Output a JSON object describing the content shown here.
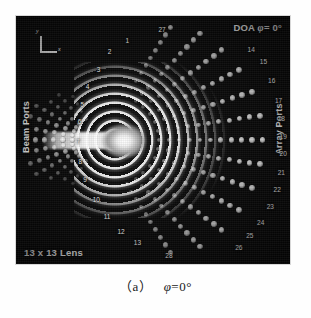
{
  "figure": {
    "title_overlay": "DOA",
    "doa_symbol": "φ",
    "doa_value": "= 0°",
    "lens_label": "13 x 13 Lens",
    "beam_ports_label": "Beam Ports",
    "array_ports_label": "Array Ports",
    "axis_y_label": "y",
    "axis_x_label": "x",
    "beam_port_numbers": [
      "1",
      "2",
      "3",
      "4",
      "5",
      "6",
      "7",
      "8",
      "9",
      "10",
      "11",
      "12",
      "13"
    ],
    "array_port_numbers": [
      "14",
      "15",
      "16",
      "17",
      "18",
      "19",
      "20",
      "21",
      "22",
      "23",
      "24",
      "25",
      "26"
    ],
    "dummy_port_numbers": [
      "27",
      "28"
    ],
    "colors": {
      "panel_background": "#0a0a0a",
      "wavefront_bright": "#ffffff",
      "label_text": "#f0f0f0",
      "page_background": "#ffffff",
      "caption_text": "#1a1a1a"
    }
  },
  "caption": {
    "index": "（a）",
    "symbol": "φ",
    "value": "=0°"
  },
  "chart_data": {
    "type": "heatmap",
    "xlabel": "",
    "ylabel": "",
    "legend_position": "none",
    "grid": false,
    "annotations": [
      {
        "text": "DOA φ= 0°",
        "position": "top-right"
      },
      {
        "text": "13 x 13 Lens",
        "position": "bottom-left"
      },
      {
        "text": "Beam Ports",
        "position": "left",
        "rotation": -90
      },
      {
        "text": "Array Ports",
        "position": "right",
        "rotation": -90
      },
      {
        "text": "y / x axis key",
        "position": "top-left"
      }
    ],
    "excited_port": "7",
    "beam_ports": [
      {
        "label": "1",
        "x": 0.4,
        "y": 0.09
      },
      {
        "label": "2",
        "x": 0.335,
        "y": 0.135
      },
      {
        "label": "3",
        "x": 0.295,
        "y": 0.205
      },
      {
        "label": "4",
        "x": 0.255,
        "y": 0.275
      },
      {
        "label": "5",
        "x": 0.235,
        "y": 0.345
      },
      {
        "label": "6",
        "x": 0.225,
        "y": 0.415
      },
      {
        "label": "7",
        "x": 0.22,
        "y": 0.495
      },
      {
        "label": "8",
        "x": 0.228,
        "y": 0.575
      },
      {
        "label": "9",
        "x": 0.245,
        "y": 0.65
      },
      {
        "label": "10",
        "x": 0.28,
        "y": 0.73
      },
      {
        "label": "11",
        "x": 0.32,
        "y": 0.8
      },
      {
        "label": "12",
        "x": 0.37,
        "y": 0.858
      },
      {
        "label": "13",
        "x": 0.43,
        "y": 0.905
      }
    ],
    "array_ports": [
      {
        "label": "14",
        "x": 0.845,
        "y": 0.125
      },
      {
        "label": "15",
        "x": 0.89,
        "y": 0.175
      },
      {
        "label": "16",
        "x": 0.92,
        "y": 0.25
      },
      {
        "label": "17",
        "x": 0.945,
        "y": 0.33
      },
      {
        "label": "18",
        "x": 0.955,
        "y": 0.405
      },
      {
        "label": "19",
        "x": 0.962,
        "y": 0.475
      },
      {
        "label": "20",
        "x": 0.962,
        "y": 0.545
      },
      {
        "label": "21",
        "x": 0.955,
        "y": 0.62
      },
      {
        "label": "22",
        "x": 0.94,
        "y": 0.69
      },
      {
        "label": "23",
        "x": 0.915,
        "y": 0.76
      },
      {
        "label": "24",
        "x": 0.88,
        "y": 0.822
      },
      {
        "label": "25",
        "x": 0.84,
        "y": 0.875
      },
      {
        "label": "26",
        "x": 0.8,
        "y": 0.922
      }
    ],
    "dummy_ports": [
      {
        "label": "27",
        "x": 0.52,
        "y": 0.045
      },
      {
        "label": "28",
        "x": 0.545,
        "y": 0.955
      }
    ]
  }
}
